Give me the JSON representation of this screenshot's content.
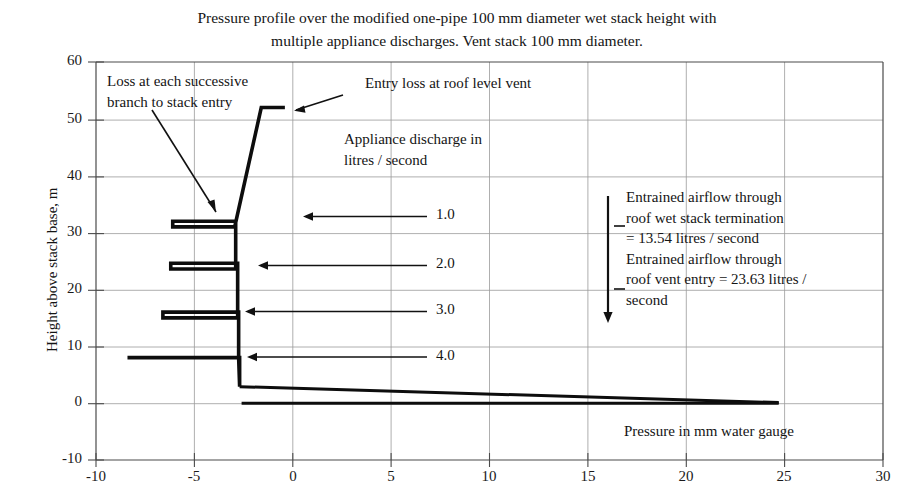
{
  "title": {
    "line1": "Pressure profile over the modified one-pipe 100 mm diameter wet stack height with",
    "line2": "multiple appliance discharges. Vent stack 100 mm diameter."
  },
  "axes": {
    "ylabel": "Height above stack base, m",
    "xlabel_inline": "Pressure in mm water gauge",
    "x_ticks": [
      "-10",
      "-5",
      "0",
      "5",
      "10",
      "15",
      "20",
      "25",
      "30"
    ],
    "y_ticks": [
      "-10",
      "0",
      "10",
      "20",
      "30",
      "40",
      "50",
      "60"
    ]
  },
  "annotations": {
    "loss_branch": {
      "line1": "Loss at each successive",
      "line2": "branch to stack entry"
    },
    "entry_loss": "Entry loss at roof level vent",
    "appliance_discharge": {
      "line1": "Appliance discharge in",
      "line2": "litres / second"
    },
    "entrained": {
      "line1": "Entrained airflow through",
      "line2": "roof wet stack termination",
      "line3": "= 13.54 litres / second",
      "line4": "Entrained airflow through",
      "line5": "roof vent entry = 23.63 litres /",
      "line6": "second"
    }
  },
  "discharge_labels": [
    {
      "value": "1.0",
      "y": 32.0,
      "arrow_from_x": 9.6,
      "arrow_to_x": 0.2
    },
    {
      "value": "2.0",
      "y": 24.0,
      "arrow_from_x": 9.6,
      "arrow_to_x": -2.0
    },
    {
      "value": "3.0",
      "y": 16.0,
      "arrow_from_x": 9.6,
      "arrow_to_x": -2.7
    },
    {
      "value": "4.0",
      "y": 8.0,
      "arrow_from_x": 9.6,
      "arrow_to_x": -2.6
    }
  ],
  "colors": {
    "curve": "#0d0d0d",
    "grid": "#9a9a9a",
    "frame": "#4a4a4a",
    "text": "#141414"
  },
  "chart_data": {
    "type": "line",
    "title": "Pressure profile over the modified one-pipe 100 mm diameter wet stack height with multiple appliance discharges. Vent stack 100 mm diameter.",
    "xlabel": "Pressure in mm water gauge",
    "ylabel": "Height above stack base, m",
    "xlim": [
      -10,
      30
    ],
    "ylim": [
      -10,
      60
    ],
    "xtick_step": 5,
    "ytick_step": 10,
    "grid": true,
    "legend": "none",
    "series": [
      {
        "name": "stack pressure profile",
        "comment": "x = pressure in mm water gauge, y = height above stack base in m",
        "points": [
          [
            -8.4,
            8.0
          ],
          [
            -2.7,
            8.0
          ],
          [
            -2.7,
            2.9
          ],
          [
            -2.75,
            8.0
          ],
          [
            -2.75,
            16.0
          ],
          [
            -6.6,
            16.0
          ],
          [
            -6.6,
            15.0
          ],
          [
            -2.8,
            15.0
          ],
          [
            -2.8,
            24.0
          ],
          [
            -2.8,
            24.6
          ],
          [
            -6.2,
            24.6
          ],
          [
            -6.2,
            23.6
          ],
          [
            -2.9,
            23.6
          ],
          [
            -2.9,
            32.0
          ],
          [
            -6.1,
            32.0
          ],
          [
            -6.1,
            31.0
          ],
          [
            -2.95,
            31.0
          ],
          [
            -1.6,
            52.0
          ],
          [
            -0.4,
            52.0
          ]
        ]
      },
      {
        "name": "base manifold upper line",
        "points": [
          [
            -2.7,
            2.9
          ],
          [
            24.7,
            0.1
          ]
        ]
      },
      {
        "name": "base manifold lower line",
        "points": [
          [
            -2.6,
            0.0
          ],
          [
            24.7,
            0.0
          ]
        ]
      }
    ],
    "annotations": [
      {
        "text": "Loss at each successive branch to stack entry",
        "points_to": [
          -6.1,
          32.0
        ]
      },
      {
        "text": "Entry loss at roof level vent",
        "points_to": [
          -0.5,
          52.0
        ]
      },
      {
        "text": "Appliance discharge in litres / second"
      },
      {
        "text": "Entrained airflow through roof wet stack termination = 13.54 litres / second"
      },
      {
        "text": "Entrained airflow through roof vent entry = 23.63 litres / second"
      },
      {
        "text": "1.0",
        "arrow_to": [
          0.2,
          32.0
        ]
      },
      {
        "text": "2.0",
        "arrow_to": [
          -2.0,
          24.0
        ]
      },
      {
        "text": "3.0",
        "arrow_to": [
          -2.7,
          16.0
        ]
      },
      {
        "text": "4.0",
        "arrow_to": [
          -2.6,
          8.0
        ]
      }
    ]
  }
}
